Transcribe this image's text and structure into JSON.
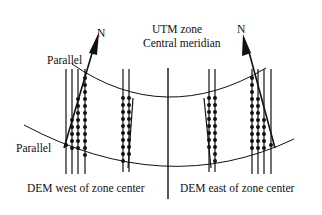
{
  "labels": {
    "north_left": "N",
    "north_right": "N",
    "parallel_top": "Parallel",
    "parallel_bottom": "Parallel",
    "meridian_line1": "UTM zone",
    "meridian_line2": "Central meridian",
    "caption_west": "DEM west of zone center",
    "caption_east": "DEM east of zone center"
  },
  "colors": {
    "stroke": "#111111",
    "background": "#ffffff"
  }
}
